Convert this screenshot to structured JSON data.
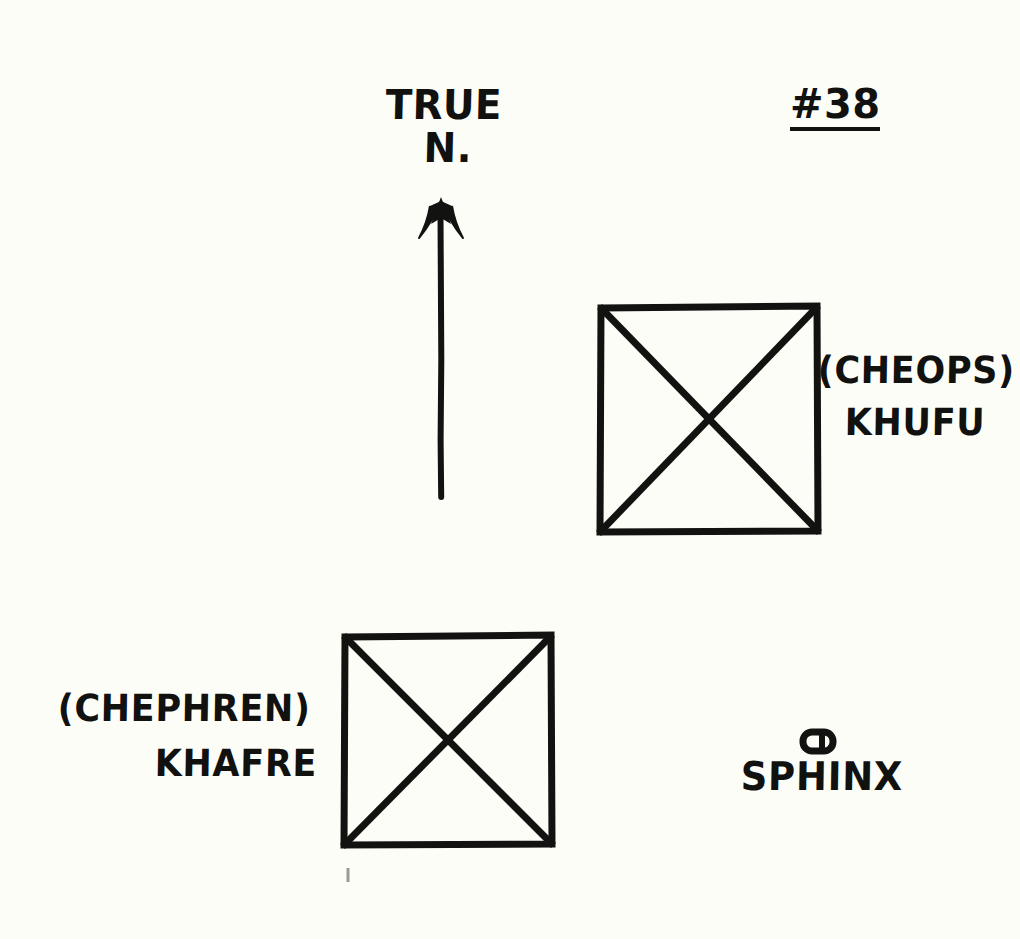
{
  "figure": {
    "kind": "hand-drawn-site-plan",
    "plate_number": "#38",
    "background_color": "#fdfdf8",
    "ink_color": "#121210"
  },
  "compass": {
    "line1": "TRUE",
    "line2": "N.",
    "direction": "north",
    "arrow_tip": {
      "x": 441,
      "y": 200
    },
    "arrow_tail": {
      "x": 441,
      "y": 497
    }
  },
  "monuments": [
    {
      "id": "khufu",
      "symbol": "square-with-diagonals",
      "alt_name": "(CHEOPS)",
      "name": "KHUFU",
      "bounds": {
        "x": 600,
        "y": 307,
        "w": 218,
        "h": 225
      }
    },
    {
      "id": "khafre",
      "symbol": "square-with-diagonals",
      "alt_name": "(CHEPHREN)",
      "name": "KHAFRE",
      "bounds": {
        "x": 344,
        "y": 636,
        "w": 208,
        "h": 209
      }
    },
    {
      "id": "sphinx",
      "symbol": "rounded-bar",
      "alt_name": "",
      "name": "SPHINX",
      "bounds": {
        "x": 801,
        "y": 731,
        "w": 33,
        "h": 21
      }
    }
  ]
}
